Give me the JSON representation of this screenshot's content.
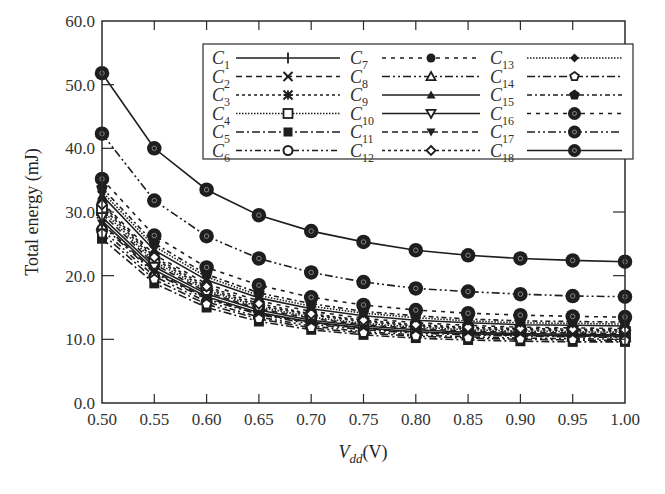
{
  "chart_data": {
    "type": "line",
    "title": "",
    "xlabel": "V_dd(V)",
    "xlabel_main": "V",
    "xlabel_sub": "dd",
    "xlabel_unit": "(V)",
    "ylabel": "Total energy (mJ)",
    "xlim": [
      0.5,
      1.0
    ],
    "ylim": [
      0.0,
      60.0
    ],
    "grid": false,
    "legend_position": "upper right (inside, 3 columns)",
    "x": [
      0.5,
      0.55,
      0.6,
      0.65,
      0.7,
      0.75,
      0.8,
      0.85,
      0.9,
      0.95,
      1.0
    ],
    "x_tick_labels": [
      "0.50",
      "0.55",
      "0.60",
      "0.65",
      "0.70",
      "0.75",
      "0.80",
      "0.85",
      "0.90",
      "0.95",
      "1.00"
    ],
    "y_ticks": [
      0,
      10,
      20,
      30,
      40,
      50,
      60
    ],
    "y_tick_labels": [
      "0.0",
      "10.0",
      "20.0",
      "30.0",
      "40.0",
      "50.0",
      "60.0"
    ],
    "series": [
      {
        "name": "C1",
        "sub": "1",
        "marker": "plus",
        "dash": "solid",
        "values": [
          28.6,
          20.9,
          16.7,
          14.2,
          12.7,
          11.8,
          11.2,
          10.9,
          10.7,
          10.6,
          10.5
        ]
      },
      {
        "name": "C2",
        "sub": "2",
        "marker": "x",
        "dash": "6,4",
        "values": [
          29.8,
          21.8,
          17.4,
          14.8,
          13.3,
          12.3,
          11.7,
          11.3,
          11.1,
          11.0,
          10.9
        ]
      },
      {
        "name": "C3",
        "sub": "3",
        "marker": "asterisk",
        "dash": "3,3",
        "values": [
          30.8,
          22.6,
          18.0,
          15.3,
          13.8,
          12.8,
          12.1,
          11.7,
          11.5,
          11.4,
          11.3
        ]
      },
      {
        "name": "C4",
        "sub": "4",
        "marker": "square-open",
        "dash": "1.5,1.5",
        "values": [
          30.3,
          22.2,
          17.7,
          15.1,
          13.5,
          12.5,
          11.9,
          11.5,
          11.3,
          11.2,
          11.1
        ]
      },
      {
        "name": "C5",
        "sub": "5",
        "marker": "square-filled",
        "dash": "8,3,2,3",
        "values": [
          25.8,
          18.8,
          15.0,
          12.8,
          11.5,
          10.7,
          10.2,
          9.9,
          9.7,
          9.6,
          9.6
        ]
      },
      {
        "name": "C6",
        "sub": "6",
        "marker": "circle-open",
        "dash": "6,3,2,3,2,3",
        "values": [
          27.2,
          19.9,
          15.9,
          13.5,
          12.1,
          11.2,
          10.7,
          10.4,
          10.2,
          10.1,
          10.0
        ]
      },
      {
        "name": "C7",
        "sub": "7",
        "marker": "circle-filled",
        "dash": "4,5",
        "values": [
          31.5,
          23.3,
          18.7,
          16.0,
          14.4,
          13.3,
          12.6,
          12.2,
          11.9,
          11.8,
          11.7
        ]
      },
      {
        "name": "C8",
        "sub": "8",
        "marker": "triangle-open",
        "dash": "8,3,2,3,2,3",
        "values": [
          27.9,
          20.4,
          16.3,
          13.9,
          12.4,
          11.5,
          11.0,
          10.7,
          10.5,
          10.4,
          10.3
        ]
      },
      {
        "name": "C9",
        "sub": "9",
        "marker": "triangle-filled",
        "dash": "solid",
        "values": [
          32.6,
          24.0,
          19.3,
          16.5,
          14.8,
          13.7,
          13.0,
          12.6,
          12.3,
          12.2,
          12.1
        ]
      },
      {
        "name": "C10",
        "sub": "10",
        "marker": "triangle-down-open",
        "dash": "solid",
        "values": [
          29.2,
          21.4,
          17.1,
          14.6,
          13.0,
          12.1,
          11.5,
          11.1,
          10.9,
          10.8,
          10.7
        ]
      },
      {
        "name": "C11",
        "sub": "11",
        "marker": "triangle-down-filled",
        "dash": "6,4",
        "values": [
          28.2,
          20.6,
          16.5,
          14.0,
          12.6,
          11.7,
          11.1,
          10.8,
          10.6,
          10.5,
          10.4
        ]
      },
      {
        "name": "C12",
        "sub": "12",
        "marker": "diamond-open",
        "dash": "3,3",
        "values": [
          31.2,
          22.9,
          18.3,
          15.6,
          14.0,
          13.0,
          12.3,
          11.9,
          11.7,
          11.6,
          11.5
        ]
      },
      {
        "name": "C13",
        "sub": "13",
        "marker": "diamond-filled",
        "dash": "1.5,1.5",
        "values": [
          33.2,
          24.6,
          19.8,
          16.9,
          15.2,
          14.1,
          13.4,
          12.9,
          12.6,
          12.5,
          12.4
        ]
      },
      {
        "name": "C14",
        "sub": "14",
        "marker": "pentagon-open",
        "dash": "8,3,2,3",
        "values": [
          26.6,
          19.4,
          15.5,
          13.2,
          11.8,
          11.0,
          10.5,
          10.2,
          10.0,
          9.9,
          9.8
        ]
      },
      {
        "name": "C15",
        "sub": "15",
        "marker": "pentagon-filled",
        "dash": "5,3,2,3",
        "values": [
          33.8,
          25.1,
          20.2,
          17.3,
          15.6,
          14.4,
          13.7,
          13.2,
          12.9,
          12.8,
          12.7
        ]
      },
      {
        "name": "C16",
        "sub": "16",
        "marker": "circle-big-filled",
        "dash": "4,5",
        "values": [
          35.2,
          26.3,
          21.3,
          18.5,
          16.6,
          15.4,
          14.6,
          14.1,
          13.8,
          13.6,
          13.5
        ]
      },
      {
        "name": "C17",
        "sub": "17",
        "marker": "circle-big-filled",
        "dash": "8,3,2,3,2,3",
        "values": [
          42.3,
          31.8,
          26.2,
          22.7,
          20.5,
          19.0,
          18.0,
          17.5,
          17.1,
          16.8,
          16.7
        ]
      },
      {
        "name": "C18",
        "sub": "18",
        "marker": "circle-big-filled",
        "dash": "solid",
        "values": [
          51.8,
          40.0,
          33.5,
          29.5,
          27.0,
          25.3,
          24.0,
          23.2,
          22.7,
          22.4,
          22.2
        ]
      }
    ]
  },
  "colors": {
    "ink": "#1e1e1e",
    "axis": "#2a2a2a",
    "background": "#ffffff"
  }
}
